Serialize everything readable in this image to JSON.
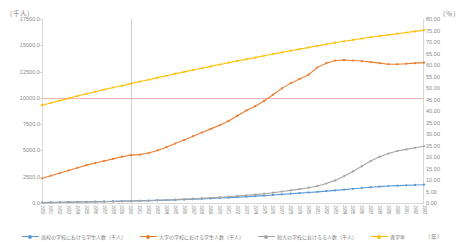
{
  "axes": {
    "left_unit": "（千人）",
    "right_unit": "（％）",
    "x_unit": "（年）",
    "left_ticks": [
      "17500.0",
      "15000.0",
      "12500.0",
      "10000.0",
      "7500.0",
      "5000.0",
      "2500.0",
      "0.0"
    ],
    "right_ticks": [
      "80.00",
      "75.00",
      "70.00",
      "65.00",
      "60.00",
      "55.00",
      "50.00",
      "45.00",
      "40.00",
      "35.00",
      "30.00",
      "25.00",
      "20.00",
      "15.00",
      "10.00",
      "5.00",
      "0.00"
    ]
  },
  "legend": [
    {
      "label": "高校の学校における学生人数（千人）",
      "color": "#5b9bd5",
      "marker": "circle-marker"
    },
    {
      "label": "大学の学校における学生人数（千人）",
      "color": "#ed7d31",
      "marker": "circle-marker"
    },
    {
      "label": "短大の学校におけるる人数（千人）",
      "color": "#a5a5a5",
      "marker": "circle-marker"
    },
    {
      "label": "進学率",
      "color": "#ffc000",
      "marker": "circle-marker"
    }
  ],
  "chart_data": {
    "type": "line",
    "title": "",
    "xlabel": "（年）",
    "ylabel": "（千人）",
    "y2label": "（％）",
    "ylim": [
      0,
      17500
    ],
    "y2lim": [
      0,
      80
    ],
    "grid": false,
    "legend_position": "bottom",
    "reference_lines": {
      "horizontal_value": 10000,
      "horizontal_color": "#f4b7b7",
      "vertical_category": "1960",
      "vertical_color": "#d0d0d0"
    },
    "categories": [
      "1950",
      "1951",
      "1952",
      "1953",
      "1954",
      "1955",
      "1956",
      "1957",
      "1958",
      "1959",
      "1960",
      "1961",
      "1962",
      "1963",
      "1964",
      "1965",
      "1966",
      "1967",
      "1968",
      "1969",
      "1970",
      "1971",
      "1972",
      "1973",
      "1974",
      "1975",
      "1976",
      "1977",
      "1978",
      "1979",
      "1980",
      "1981",
      "1982",
      "1983",
      "1984",
      "1985",
      "1986",
      "1987",
      "1988",
      "1989",
      "1990",
      "1991",
      "1992",
      "1993"
    ],
    "series": [
      {
        "name": "高校の学校における学生人数（千人）",
        "color": "#5b9bd5",
        "axis": "left",
        "values": [
          40,
          55,
          70,
          85,
          100,
          115,
          130,
          145,
          160,
          175,
          190,
          210,
          230,
          250,
          275,
          300,
          330,
          360,
          395,
          430,
          470,
          510,
          555,
          600,
          650,
          700,
          760,
          820,
          880,
          940,
          1000,
          1060,
          1130,
          1200,
          1275,
          1350,
          1430,
          1500,
          1560,
          1610,
          1650,
          1680,
          1710,
          1740
        ]
      },
      {
        "name": "大学の学校における学生人数（千人）",
        "color": "#ed7d31",
        "axis": "left",
        "values": [
          2350,
          2600,
          2850,
          3100,
          3350,
          3600,
          3800,
          4000,
          4200,
          4400,
          4550,
          4600,
          4750,
          5000,
          5300,
          5650,
          6000,
          6350,
          6700,
          7050,
          7400,
          7800,
          8300,
          8800,
          9200,
          9700,
          10300,
          10900,
          11400,
          11800,
          12200,
          12900,
          13300,
          13550,
          13600,
          13550,
          13500,
          13400,
          13300,
          13200,
          13200,
          13250,
          13300,
          13350
        ]
      },
      {
        "name": "短大の学校におけるる人数（千人）",
        "color": "#a5a5a5",
        "axis": "left",
        "values": [
          30,
          40,
          50,
          60,
          75,
          90,
          105,
          120,
          140,
          160,
          180,
          205,
          230,
          260,
          290,
          325,
          365,
          405,
          450,
          495,
          545,
          600,
          665,
          730,
          800,
          880,
          980,
          1090,
          1200,
          1320,
          1450,
          1620,
          1850,
          2150,
          2550,
          3000,
          3500,
          4000,
          4400,
          4700,
          4950,
          5100,
          5250,
          5400
        ]
      },
      {
        "name": "進学率",
        "color": "#ffc000",
        "axis": "right",
        "values": [
          42.5,
          43.5,
          44.5,
          45.5,
          46.5,
          47.5,
          48.4,
          49.3,
          50.2,
          51.0,
          51.9,
          52.8,
          53.6,
          54.5,
          55.3,
          56.2,
          57.0,
          57.8,
          58.6,
          59.4,
          60.2,
          61.0,
          61.8,
          62.5,
          63.2,
          64.0,
          64.8,
          65.5,
          66.2,
          66.9,
          67.6,
          68.3,
          69.0,
          69.7,
          70.3,
          70.9,
          71.5,
          72.1,
          72.6,
          73.1,
          73.6,
          74.1,
          74.6,
          75.1
        ]
      }
    ]
  }
}
